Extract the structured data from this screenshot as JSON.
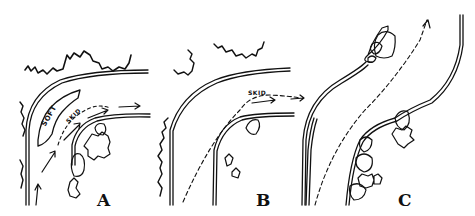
{
  "figure": {
    "panels": [
      {
        "id": "A",
        "label": "A",
        "annotations": [
          "SOFT",
          "SKID"
        ]
      },
      {
        "id": "B",
        "label": "B",
        "annotations": [
          "SKID"
        ]
      },
      {
        "id": "C",
        "label": "C",
        "annotations": []
      }
    ],
    "colors": {
      "ink": "#111111",
      "background": "#ffffff"
    }
  }
}
